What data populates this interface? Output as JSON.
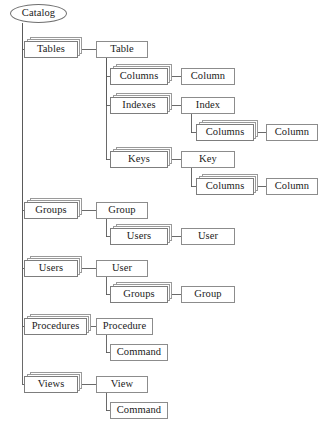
{
  "diagram": {
    "title": "Catalog",
    "type": "object-model-tree",
    "root": {
      "id": "catalog",
      "label": "Catalog",
      "shape": "ellipse",
      "x": 10,
      "y": 4,
      "w": 57,
      "h": 19
    },
    "nodes": [
      {
        "id": "tables",
        "label": "Tables",
        "kind": "collection",
        "x": 24,
        "y": 41,
        "w": 54,
        "h": 17
      },
      {
        "id": "table",
        "label": "Table",
        "kind": "entity",
        "x": 96,
        "y": 41,
        "w": 52,
        "h": 17
      },
      {
        "id": "tbl-columns",
        "label": "Columns",
        "kind": "collection",
        "x": 110,
        "y": 68,
        "w": 58,
        "h": 17
      },
      {
        "id": "tbl-column",
        "label": "Column",
        "kind": "entity",
        "x": 181,
        "y": 68,
        "w": 54,
        "h": 17
      },
      {
        "id": "tbl-indexes",
        "label": "Indexes",
        "kind": "collection",
        "x": 110,
        "y": 97,
        "w": 58,
        "h": 17
      },
      {
        "id": "index",
        "label": "Index",
        "kind": "entity",
        "x": 181,
        "y": 97,
        "w": 54,
        "h": 17
      },
      {
        "id": "idx-columns",
        "label": "Columns",
        "kind": "collection",
        "x": 196,
        "y": 124,
        "w": 58,
        "h": 17
      },
      {
        "id": "idx-column",
        "label": "Column",
        "kind": "entity",
        "x": 266,
        "y": 124,
        "w": 52,
        "h": 17
      },
      {
        "id": "tbl-keys",
        "label": "Keys",
        "kind": "collection",
        "x": 110,
        "y": 151,
        "w": 58,
        "h": 17
      },
      {
        "id": "key",
        "label": "Key",
        "kind": "entity",
        "x": 181,
        "y": 151,
        "w": 54,
        "h": 17
      },
      {
        "id": "key-columns",
        "label": "Columns",
        "kind": "collection",
        "x": 196,
        "y": 178,
        "w": 58,
        "h": 17
      },
      {
        "id": "key-column",
        "label": "Column",
        "kind": "entity",
        "x": 266,
        "y": 178,
        "w": 52,
        "h": 17
      },
      {
        "id": "groups",
        "label": "Groups",
        "kind": "collection",
        "x": 24,
        "y": 202,
        "w": 54,
        "h": 17
      },
      {
        "id": "group",
        "label": "Group",
        "kind": "entity",
        "x": 96,
        "y": 202,
        "w": 52,
        "h": 17
      },
      {
        "id": "grp-users",
        "label": "Users",
        "kind": "collection",
        "x": 110,
        "y": 228,
        "w": 58,
        "h": 17
      },
      {
        "id": "grp-user",
        "label": "User",
        "kind": "entity",
        "x": 181,
        "y": 228,
        "w": 54,
        "h": 17
      },
      {
        "id": "users",
        "label": "Users",
        "kind": "collection",
        "x": 24,
        "y": 260,
        "w": 54,
        "h": 17
      },
      {
        "id": "user",
        "label": "User",
        "kind": "entity",
        "x": 96,
        "y": 260,
        "w": 52,
        "h": 17
      },
      {
        "id": "usr-groups",
        "label": "Groups",
        "kind": "collection",
        "x": 110,
        "y": 286,
        "w": 58,
        "h": 17
      },
      {
        "id": "usr-group",
        "label": "Group",
        "kind": "entity",
        "x": 181,
        "y": 286,
        "w": 54,
        "h": 17
      },
      {
        "id": "procedures",
        "label": "Procedures",
        "kind": "collection",
        "x": 24,
        "y": 318,
        "w": 63,
        "h": 17
      },
      {
        "id": "procedure",
        "label": "Procedure",
        "kind": "entity",
        "x": 96,
        "y": 318,
        "w": 57,
        "h": 17
      },
      {
        "id": "proc-command",
        "label": "Command",
        "kind": "entity",
        "x": 110,
        "y": 344,
        "w": 58,
        "h": 17
      },
      {
        "id": "views",
        "label": "Views",
        "kind": "collection",
        "x": 24,
        "y": 376,
        "w": 54,
        "h": 17
      },
      {
        "id": "view",
        "label": "View",
        "kind": "entity",
        "x": 96,
        "y": 376,
        "w": 52,
        "h": 17
      },
      {
        "id": "view-command",
        "label": "Command",
        "kind": "entity",
        "x": 110,
        "y": 402,
        "w": 58,
        "h": 17
      }
    ],
    "edges": [
      {
        "from": "catalog",
        "to": "tables",
        "style": "elbow-down"
      },
      {
        "from": "catalog",
        "to": "groups",
        "style": "elbow-down"
      },
      {
        "from": "catalog",
        "to": "users",
        "style": "elbow-down"
      },
      {
        "from": "catalog",
        "to": "procedures",
        "style": "elbow-down"
      },
      {
        "from": "catalog",
        "to": "views",
        "style": "elbow-down"
      },
      {
        "from": "tables",
        "to": "table",
        "style": "straight"
      },
      {
        "from": "table",
        "to": "tbl-columns",
        "style": "elbow-down"
      },
      {
        "from": "table",
        "to": "tbl-indexes",
        "style": "elbow-down"
      },
      {
        "from": "table",
        "to": "tbl-keys",
        "style": "elbow-down"
      },
      {
        "from": "tbl-columns",
        "to": "tbl-column",
        "style": "straight"
      },
      {
        "from": "tbl-indexes",
        "to": "index",
        "style": "straight"
      },
      {
        "from": "index",
        "to": "idx-columns",
        "style": "elbow-down"
      },
      {
        "from": "idx-columns",
        "to": "idx-column",
        "style": "straight"
      },
      {
        "from": "tbl-keys",
        "to": "key",
        "style": "straight"
      },
      {
        "from": "key",
        "to": "key-columns",
        "style": "elbow-down"
      },
      {
        "from": "key-columns",
        "to": "key-column",
        "style": "straight"
      },
      {
        "from": "groups",
        "to": "group",
        "style": "straight"
      },
      {
        "from": "group",
        "to": "grp-users",
        "style": "elbow-down"
      },
      {
        "from": "grp-users",
        "to": "grp-user",
        "style": "straight"
      },
      {
        "from": "users",
        "to": "user",
        "style": "straight"
      },
      {
        "from": "user",
        "to": "usr-groups",
        "style": "elbow-down"
      },
      {
        "from": "usr-groups",
        "to": "usr-group",
        "style": "straight"
      },
      {
        "from": "procedures",
        "to": "procedure",
        "style": "straight"
      },
      {
        "from": "procedure",
        "to": "proc-command",
        "style": "elbow-down"
      },
      {
        "from": "views",
        "to": "view",
        "style": "straight"
      },
      {
        "from": "view",
        "to": "view-command",
        "style": "elbow-down"
      }
    ],
    "colors": {
      "background": "#ffffff",
      "node_border": "#7d7d7d",
      "stack_border": "#9a9a9a",
      "edge": "#5a5a5a",
      "text": "#1a1a1a"
    }
  }
}
